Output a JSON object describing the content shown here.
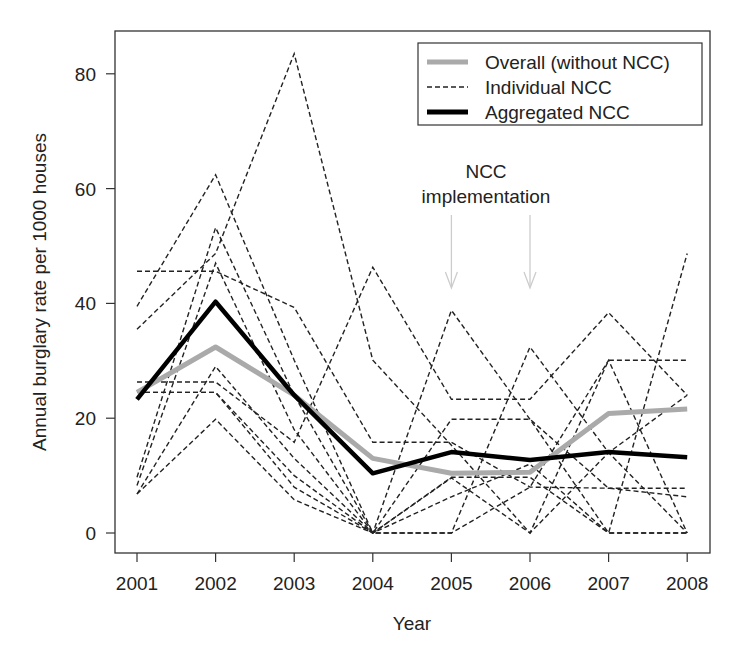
{
  "chart_data": {
    "type": "line",
    "title": "",
    "xlabel": "Year",
    "ylabel": "Annual burglary rate per 1000 houses",
    "x": [
      2001,
      2002,
      2003,
      2004,
      2005,
      2006,
      2007,
      2008
    ],
    "x_tick_labels": [
      "2001",
      "2002",
      "2003",
      "2004",
      "2005",
      "2006",
      "2007",
      "2008"
    ],
    "y_ticks": [
      0,
      20,
      40,
      60,
      80
    ],
    "y_tick_labels": [
      "0",
      "20",
      "40",
      "60",
      "80"
    ],
    "ylim": [
      -4,
      87
    ],
    "grid": false,
    "legend_position": "top-right",
    "legend": [
      {
        "label": "Overall (without NCC)",
        "style": "solid-thick",
        "color": "#aaaaaa"
      },
      {
        "label": "Individual NCC",
        "style": "dashed",
        "color": "#222222"
      },
      {
        "label": "Aggregated NCC",
        "style": "solid-thick",
        "color": "#000000"
      }
    ],
    "series": [
      {
        "name": "Overall (without NCC)",
        "kind": "overall",
        "color": "#aaaaaa",
        "values": [
          24.5,
          32.4,
          24.0,
          13.0,
          10.4,
          10.6,
          20.8,
          21.6
        ]
      },
      {
        "name": "Aggregated NCC",
        "kind": "aggregated",
        "color": "#000000",
        "values": [
          23.3,
          40.3,
          24.0,
          10.4,
          14.1,
          12.7,
          14.1,
          13.2
        ]
      },
      {
        "name": "Individual NCC 1",
        "kind": "individual",
        "values": [
          45.6,
          45.6,
          39.3,
          15.8,
          15.8,
          8.0,
          7.8,
          7.8
        ]
      },
      {
        "name": "Individual NCC 2",
        "kind": "individual",
        "values": [
          39.5,
          62.4,
          30.1,
          0,
          9.7,
          9.7,
          0,
          0
        ]
      },
      {
        "name": "Individual NCC 3",
        "kind": "individual",
        "values": [
          35.5,
          48.7,
          83.5,
          30.1,
          15.3,
          0,
          30.1,
          30.1
        ]
      },
      {
        "name": "Individual NCC 4",
        "kind": "individual",
        "values": [
          26.3,
          26.3,
          15.8,
          46.3,
          23.3,
          23.3,
          38.4,
          24.0
        ]
      },
      {
        "name": "Individual NCC 5",
        "kind": "individual",
        "values": [
          24.5,
          24.5,
          10.0,
          0,
          38.8,
          19.8,
          0,
          48.7
        ]
      },
      {
        "name": "Individual NCC 6",
        "kind": "individual",
        "values": [
          9.7,
          53.2,
          24.0,
          0,
          0,
          32.4,
          14.0,
          0
        ]
      },
      {
        "name": "Individual NCC 7",
        "kind": "individual",
        "values": [
          8.3,
          47.0,
          18.0,
          0,
          19.8,
          19.8,
          7.8,
          6.3
        ]
      },
      {
        "name": "Individual NCC 8",
        "kind": "individual",
        "values": [
          6.8,
          19.8,
          5.8,
          0,
          9.6,
          0,
          14.0,
          24.0
        ]
      },
      {
        "name": "Individual NCC 9",
        "kind": "individual",
        "values": [
          6.8,
          29.0,
          13.0,
          0,
          6.3,
          12.0,
          0,
          0
        ]
      },
      {
        "name": "Individual NCC 10",
        "kind": "individual",
        "values": [
          24.5,
          24.5,
          8.0,
          0,
          0,
          8.0,
          30.1,
          0
        ]
      }
    ],
    "annotations": [
      {
        "text_lines": [
          "NCC",
          "implementation"
        ],
        "arrows_at_x": [
          2005,
          2006
        ],
        "arrow_color": "#cccccc"
      }
    ]
  }
}
